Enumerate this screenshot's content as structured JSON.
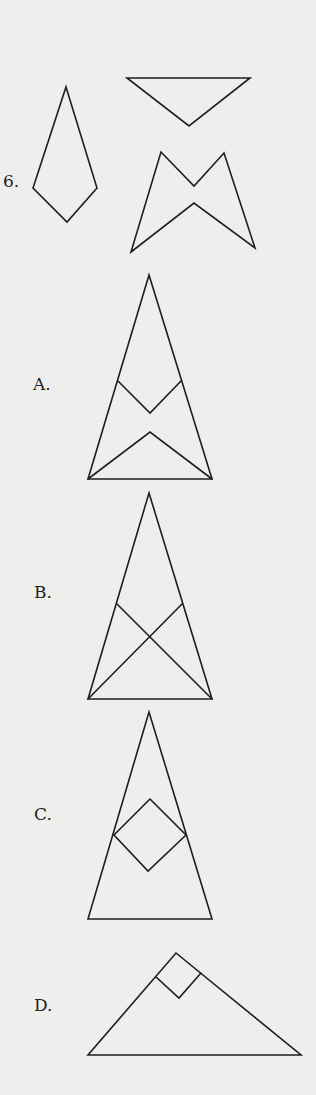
{
  "question": {
    "number_label": "6.",
    "given_pieces": [
      {
        "id": "kite",
        "points": [
          [
            66,
            87
          ],
          [
            97,
            188
          ],
          [
            67,
            222
          ],
          [
            33,
            188
          ]
        ]
      },
      {
        "id": "inverted-triangle",
        "points": [
          [
            127,
            78
          ],
          [
            250,
            78
          ],
          [
            189,
            126
          ]
        ]
      },
      {
        "id": "bowtie",
        "points": [
          [
            161,
            152
          ],
          [
            194,
            186
          ],
          [
            224,
            153
          ],
          [
            255,
            248
          ],
          [
            194,
            203
          ],
          [
            131,
            252
          ]
        ]
      }
    ]
  },
  "options": [
    {
      "label": "A.",
      "label_pos": [
        33,
        376
      ],
      "outline": [
        [
          149,
          275
        ],
        [
          212,
          479
        ],
        [
          88,
          479
        ]
      ],
      "inner_lines": [
        [
          [
            118,
            381
          ],
          [
            150,
            413
          ],
          [
            181,
            381
          ]
        ],
        [
          [
            88,
            479
          ],
          [
            150,
            432
          ],
          [
            212,
            479
          ]
        ]
      ]
    },
    {
      "label": "B.",
      "label_pos": [
        34,
        584
      ],
      "outline": [
        [
          149,
          493
        ],
        [
          212,
          699
        ],
        [
          88,
          699
        ]
      ],
      "inner_lines": [
        [
          [
            117,
            604
          ],
          [
            212,
            699
          ]
        ],
        [
          [
            182,
            604
          ],
          [
            88,
            699
          ]
        ]
      ]
    },
    {
      "label": "C.",
      "label_pos": [
        34,
        806
      ],
      "outline": [
        [
          149,
          712
        ],
        [
          212,
          919
        ],
        [
          88,
          919
        ]
      ],
      "inner_lines": [
        [
          [
            150,
            799
          ],
          [
            186,
            835
          ],
          [
            148,
            871
          ],
          [
            114,
            835
          ],
          [
            150,
            799
          ]
        ]
      ]
    },
    {
      "label": "D.",
      "label_pos": [
        34,
        997
      ],
      "outline": [
        [
          176,
          953
        ],
        [
          301,
          1055
        ],
        [
          88,
          1055
        ]
      ],
      "inner_lines": [
        [
          [
            156,
            977
          ],
          [
            179,
            998
          ],
          [
            201,
            973
          ]
        ]
      ]
    }
  ],
  "colors": {
    "background": "#eeeeec",
    "stroke": "#1e1e1e",
    "text": "#222222"
  }
}
